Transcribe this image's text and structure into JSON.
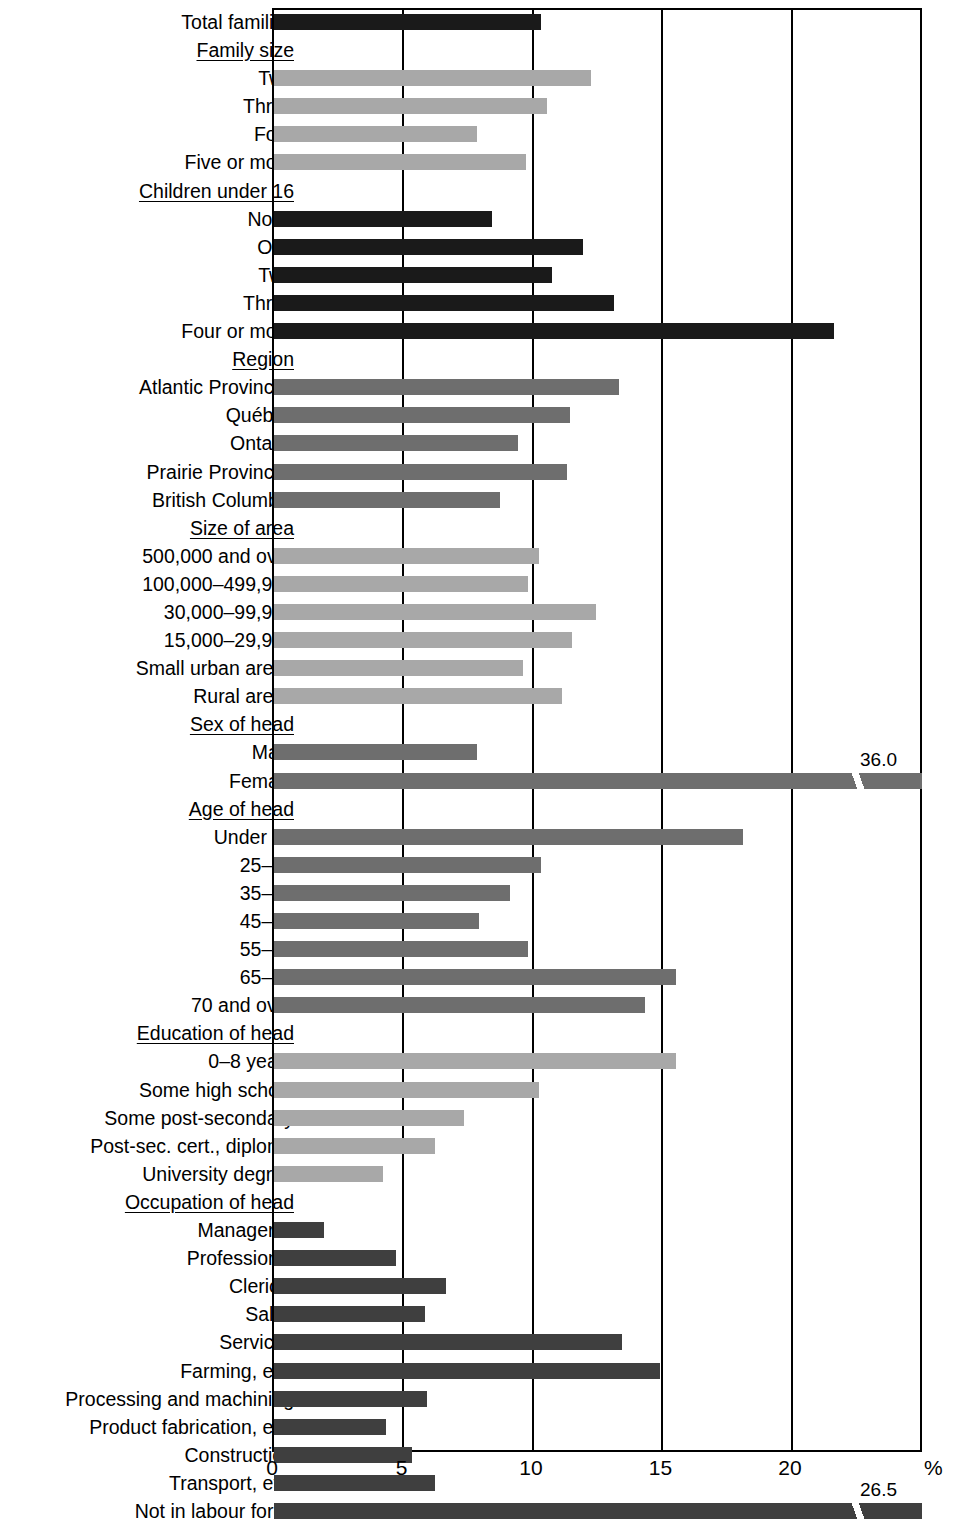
{
  "chart_data": {
    "type": "bar",
    "orientation": "horizontal",
    "title": "",
    "xlabel": "%",
    "ylabel": "",
    "xlim": [
      0,
      25.1
    ],
    "ticks": [
      "0",
      "5",
      "10",
      "15",
      "20"
    ],
    "tick_values": [
      0,
      5,
      10,
      15,
      20
    ],
    "unit_label": "%",
    "grid": true,
    "rows": [
      {
        "label": "Total families",
        "type": "bar",
        "value": 10.4,
        "shade": "sh-black"
      },
      {
        "label": "Family size",
        "type": "group"
      },
      {
        "label": "Two",
        "type": "bar",
        "value": 12.3,
        "shade": "sh-light"
      },
      {
        "label": "Three",
        "type": "bar",
        "value": 10.6,
        "shade": "sh-light"
      },
      {
        "label": "Four",
        "type": "bar",
        "value": 7.9,
        "shade": "sh-light"
      },
      {
        "label": "Five or more",
        "type": "bar",
        "value": 9.8,
        "shade": "sh-light"
      },
      {
        "label": "Children under 16",
        "type": "group"
      },
      {
        "label": "None",
        "type": "bar",
        "value": 8.5,
        "shade": "sh-black"
      },
      {
        "label": "One",
        "type": "bar",
        "value": 12.0,
        "shade": "sh-black"
      },
      {
        "label": "Two",
        "type": "bar",
        "value": 10.8,
        "shade": "sh-black"
      },
      {
        "label": "Three",
        "type": "bar",
        "value": 13.2,
        "shade": "sh-black"
      },
      {
        "label": "Four or more",
        "type": "bar",
        "value": 21.7,
        "shade": "sh-black"
      },
      {
        "label": "Region",
        "type": "group"
      },
      {
        "label": "Atlantic Provinces",
        "type": "bar",
        "value": 13.4,
        "shade": "sh-mid"
      },
      {
        "label": "Québec",
        "type": "bar",
        "value": 11.5,
        "shade": "sh-mid"
      },
      {
        "label": "Ontario",
        "type": "bar",
        "value": 9.5,
        "shade": "sh-mid"
      },
      {
        "label": "Prairie Provinces",
        "type": "bar",
        "value": 11.4,
        "shade": "sh-mid"
      },
      {
        "label": "British Columbia",
        "type": "bar",
        "value": 8.8,
        "shade": "sh-mid"
      },
      {
        "label": "Size of area",
        "type": "group"
      },
      {
        "label": "500,000 and over",
        "type": "bar",
        "value": 10.3,
        "shade": "sh-light"
      },
      {
        "label": "100,000–499,999",
        "type": "bar",
        "value": 9.9,
        "shade": "sh-light"
      },
      {
        "label": "30,000–99,999",
        "type": "bar",
        "value": 12.5,
        "shade": "sh-light"
      },
      {
        "label": "15,000–29,999",
        "type": "bar",
        "value": 11.6,
        "shade": "sh-light"
      },
      {
        "label": "Small urban areas",
        "type": "bar",
        "value": 9.7,
        "shade": "sh-light"
      },
      {
        "label": "Rural areas",
        "type": "bar",
        "value": 11.2,
        "shade": "sh-light"
      },
      {
        "label": "Sex of head",
        "type": "group"
      },
      {
        "label": "Male",
        "type": "bar",
        "value": 7.9,
        "shade": "sh-mid"
      },
      {
        "label": "Female",
        "type": "bar",
        "value": 36.0,
        "shade": "sh-mid",
        "broken": true,
        "value_label": "36.0"
      },
      {
        "label": "Age of head",
        "type": "group"
      },
      {
        "label": "Under 25",
        "type": "bar",
        "value": 18.2,
        "shade": "sh-mid"
      },
      {
        "label": "25–34",
        "type": "bar",
        "value": 10.4,
        "shade": "sh-mid"
      },
      {
        "label": "35–44",
        "type": "bar",
        "value": 9.2,
        "shade": "sh-mid"
      },
      {
        "label": "45–54",
        "type": "bar",
        "value": 8.0,
        "shade": "sh-mid"
      },
      {
        "label": "55–64",
        "type": "bar",
        "value": 9.9,
        "shade": "sh-mid"
      },
      {
        "label": "65–69",
        "type": "bar",
        "value": 15.6,
        "shade": "sh-mid"
      },
      {
        "label": "70 and over",
        "type": "bar",
        "value": 14.4,
        "shade": "sh-mid"
      },
      {
        "label": "Education of head",
        "type": "group"
      },
      {
        "label": "0–8 years",
        "type": "bar",
        "value": 15.6,
        "shade": "sh-light"
      },
      {
        "label": "Some high school",
        "type": "bar",
        "value": 10.3,
        "shade": "sh-light"
      },
      {
        "label": "Some post-secondary",
        "type": "bar",
        "value": 7.4,
        "shade": "sh-light"
      },
      {
        "label": "Post-sec. cert., diploma",
        "type": "bar",
        "value": 6.3,
        "shade": "sh-light"
      },
      {
        "label": "University degree",
        "type": "bar",
        "value": 4.3,
        "shade": "sh-light"
      },
      {
        "label": "Occupation of head",
        "type": "group"
      },
      {
        "label": "Managerial",
        "type": "bar",
        "value": 2.0,
        "shade": "sh-dark"
      },
      {
        "label": "Professional",
        "type": "bar",
        "value": 4.8,
        "shade": "sh-dark"
      },
      {
        "label": "Clerical",
        "type": "bar",
        "value": 6.7,
        "shade": "sh-dark"
      },
      {
        "label": "Sales",
        "type": "bar",
        "value": 5.9,
        "shade": "sh-dark"
      },
      {
        "label": "Services",
        "type": "bar",
        "value": 13.5,
        "shade": "sh-dark"
      },
      {
        "label": "Farming, etc.",
        "type": "bar",
        "value": 15.0,
        "shade": "sh-dark"
      },
      {
        "label": "Processing and machining",
        "type": "bar",
        "value": 6.0,
        "shade": "sh-dark"
      },
      {
        "label": "Product fabrication, etc.",
        "type": "bar",
        "value": 4.4,
        "shade": "sh-dark"
      },
      {
        "label": "Construction",
        "type": "bar",
        "value": 5.4,
        "shade": "sh-dark"
      },
      {
        "label": "Transport, etc.",
        "type": "bar",
        "value": 6.3,
        "shade": "sh-dark"
      },
      {
        "label": "Not in labour force",
        "type": "bar",
        "value": 26.5,
        "shade": "sh-dark",
        "broken": true,
        "value_label": "26.5"
      }
    ]
  }
}
